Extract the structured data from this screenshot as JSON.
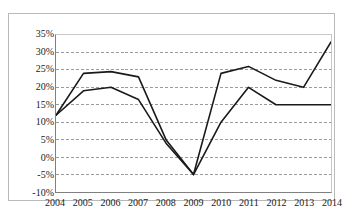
{
  "chart_data": {
    "type": "line",
    "title": "",
    "xlabel": "",
    "ylabel": "",
    "categories": [
      "2004",
      "2005",
      "2006",
      "2007",
      "2008",
      "2009",
      "2010",
      "2011",
      "2012",
      "2013",
      "2014"
    ],
    "series": [
      {
        "name": "series-1",
        "color": "#1a1a1a",
        "values": [
          12,
          24,
          24.5,
          23,
          5,
          -5,
          24,
          26,
          22,
          20,
          33
        ]
      },
      {
        "name": "series-2",
        "color": "#1a1a1a",
        "values": [
          12,
          19,
          20,
          16.5,
          4,
          -5,
          10,
          20,
          15,
          15,
          15
        ]
      }
    ],
    "ylim": [
      -10,
      35
    ],
    "ytick_labels": [
      "35%",
      "30%",
      "25%",
      "20%",
      "15%",
      "10%",
      "5%",
      "0%",
      "-5%",
      "-10%"
    ],
    "ytick_values": [
      35,
      30,
      25,
      20,
      15,
      10,
      5,
      0,
      -5,
      -10
    ],
    "grid": true,
    "grid_style": "dashed",
    "grid_color": "#9a9a9a",
    "legend": "none",
    "axis_color": "#808080",
    "background": "#ffffff"
  }
}
